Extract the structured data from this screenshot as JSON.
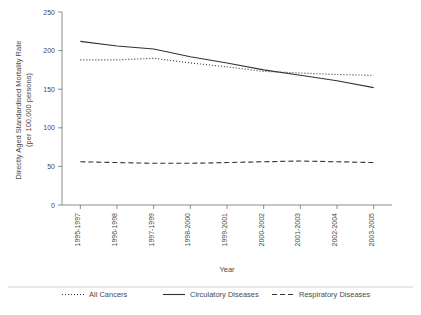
{
  "chart_data": {
    "type": "line",
    "title": "",
    "xlabel": "Year",
    "ylabel": "Directly Aged Standardised Mortality Rate (per 100,000 persons)",
    "ylabel_line1": "Directly Aged Standardised Mortality Rate",
    "ylabel_line2": "(per 100,000 persons)",
    "categories": [
      "1995-1997",
      "1996-1998",
      "1997-1999",
      "1998-2000",
      "1999-2001",
      "2000-2002",
      "2001-2003",
      "2002-2004",
      "2003-2005"
    ],
    "yticks": [
      0,
      50,
      100,
      150,
      200,
      250
    ],
    "ylim": [
      0,
      250
    ],
    "grid": false,
    "legend_position": "bottom",
    "series": [
      {
        "name": "All Cancers",
        "style": "dotted",
        "color": "#333333",
        "values": [
          188,
          188,
          190,
          184,
          179,
          173,
          171,
          169,
          168
        ]
      },
      {
        "name": "Circulatory Diseases",
        "style": "solid",
        "color": "#333333",
        "values": [
          212,
          206,
          202,
          192,
          184,
          175,
          168,
          161,
          152
        ]
      },
      {
        "name": "Respiratory Diseases",
        "style": "dashed",
        "color": "#333333",
        "values": [
          56,
          55,
          54,
          54,
          55,
          56,
          57,
          56,
          55
        ]
      }
    ]
  }
}
